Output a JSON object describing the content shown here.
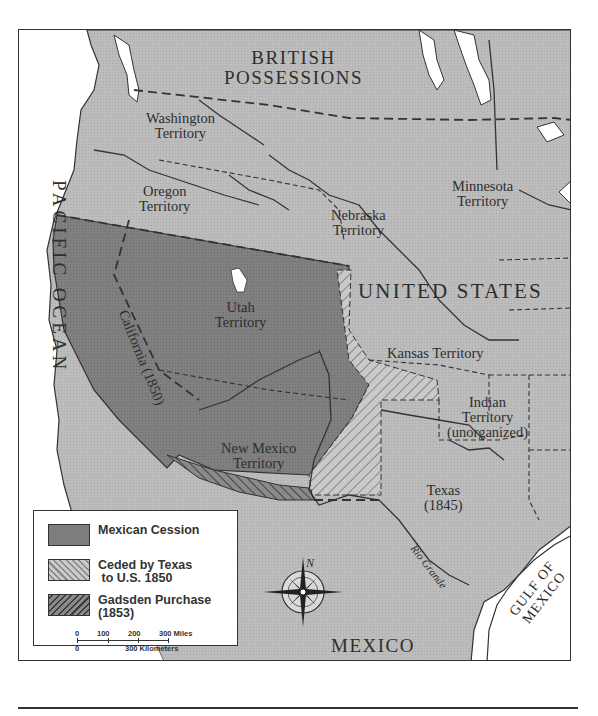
{
  "map": {
    "title_regions": {
      "british_possessions": [
        "BRITISH",
        "POSSESSIONS"
      ],
      "united_states": "UNITED  STATES",
      "mexico": "MEXICO",
      "pacific_ocean": "PACIFIC   OCEAN",
      "gulf_of_mexico": [
        "GULF OF",
        "MEXICO"
      ]
    },
    "territories": {
      "washington": [
        "Washington",
        "Territory"
      ],
      "oregon": [
        "Oregon",
        "Territory"
      ],
      "minnesota": [
        "Minnesota",
        "Territory"
      ],
      "nebraska": [
        "Nebraska",
        "Territory"
      ],
      "utah": [
        "Utah",
        "Territory"
      ],
      "kansas": "Kansas Territory",
      "california": "California (1850)",
      "new_mexico": [
        "New Mexico",
        "Territory"
      ],
      "indian": [
        "Indian",
        "Territory",
        "(unorganized)"
      ],
      "texas": [
        "Texas",
        "(1845)"
      ]
    },
    "rivers": {
      "rio_grande": "Rio Grande"
    },
    "compass": {
      "north_label": "N"
    },
    "colors": {
      "land": "#b9b9b9",
      "cession": "#7d7d7d",
      "water": "#ffffff",
      "border": "#333333"
    }
  },
  "legend": {
    "items": [
      {
        "label_line1": "Mexican Cession",
        "label_line2": "",
        "pattern": "solid-dark"
      },
      {
        "label_line1": "Ceded by Texas",
        "label_line2": " to U.S. 1850",
        "pattern": "hatch-light"
      },
      {
        "label_line1": "Gadsden Purchase",
        "label_line2": "(1853)",
        "pattern": "hatch-dark"
      }
    ],
    "scale": {
      "miles_ticks": [
        "0",
        "100",
        "200",
        "300 Miles"
      ],
      "km_ticks": [
        "0",
        "300 Kilometers"
      ]
    }
  }
}
